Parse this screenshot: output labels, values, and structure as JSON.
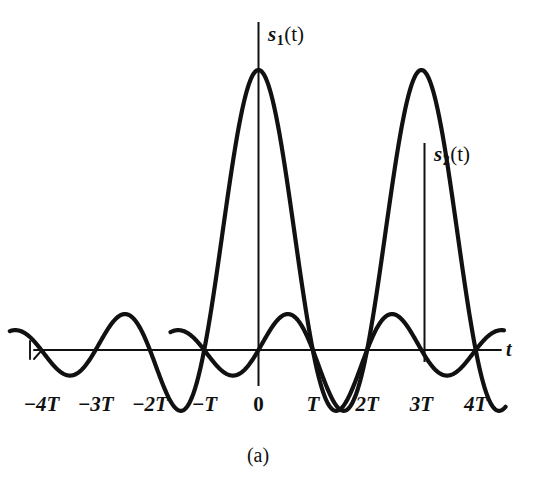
{
  "figure": {
    "caption": "(a)",
    "axis_label_t": "t",
    "background_color": "#ffffff",
    "ink_color": "#111111"
  },
  "signals": [
    {
      "name": "s1",
      "label_base": "s",
      "label_sub": "1",
      "label_arg": "(t)",
      "center_tick": "0"
    },
    {
      "name": "s2",
      "label_base": "s",
      "label_sub": "2",
      "label_arg": "(t)",
      "center_tick": "3T"
    }
  ],
  "ticks": [
    {
      "label": "−4T",
      "value": -4,
      "italic": true
    },
    {
      "label": "−3T",
      "value": -3,
      "italic": true
    },
    {
      "label": "−2T",
      "value": -2,
      "italic": true
    },
    {
      "label": "−T",
      "value": -1,
      "italic": true
    },
    {
      "label": "0",
      "value": 0,
      "italic": false
    },
    {
      "label": "T",
      "value": 1,
      "italic": true
    },
    {
      "label": "2T",
      "value": 2,
      "italic": true
    },
    {
      "label": "3T",
      "value": 3,
      "italic": true
    },
    {
      "label": "4T",
      "value": 4,
      "italic": true
    }
  ],
  "chart_data": {
    "type": "line",
    "title": "",
    "subtitle": "(a)",
    "xlabel": "t",
    "ylabel": "",
    "grid": false,
    "legend": "inline-annotations",
    "xlim": [
      -4.6,
      4.6
    ],
    "ylim": [
      -0.28,
      1.12
    ],
    "x_tick_values": [
      -4,
      -3,
      -2,
      -1,
      0,
      1,
      2,
      3,
      4
    ],
    "x_tick_labels": [
      "−4T",
      "−3T",
      "−2T",
      "−T",
      "0",
      "T",
      "2T",
      "3T",
      "4T"
    ],
    "x_unit": "T",
    "annotations": [
      {
        "text": "s1(t)",
        "at_x": 0,
        "at_y": 1.0,
        "stem": true
      },
      {
        "text": "s2(t)",
        "at_x": 3,
        "at_y": 1.0,
        "stem": true
      }
    ],
    "series": [
      {
        "name": "s1(t)",
        "formula": "sinc(t/T)",
        "peak_x": 0,
        "peak_y": 1.0,
        "zeros_at": [
          -4,
          -3,
          -2,
          -1,
          1,
          2,
          3,
          4
        ],
        "x": [
          -4.6,
          -4.5,
          -4,
          -3.5,
          -3,
          -2.5,
          -2,
          -1.5,
          -1,
          -0.75,
          -0.5,
          -0.25,
          0,
          0.25,
          0.5,
          0.75,
          1,
          1.5,
          2,
          2.5,
          3,
          3.5,
          4,
          4.5,
          4.6
        ],
        "values": [
          0.06,
          0.071,
          0,
          -0.091,
          0,
          0.127,
          0,
          -0.212,
          0,
          0.3,
          0.637,
          0.9,
          1.0,
          0.9,
          0.637,
          0.3,
          0,
          -0.212,
          0,
          0.127,
          0,
          -0.091,
          0,
          0.071,
          0.06
        ]
      },
      {
        "name": "s2(t)",
        "formula": "sinc((t-3T)/T)",
        "peak_x": 3,
        "peak_y": 1.0,
        "zeros_at": [
          -1,
          0,
          1,
          2,
          4
        ],
        "x": [
          -1.6,
          -1.5,
          -1,
          -0.5,
          0,
          0.5,
          1,
          1.5,
          2,
          2.25,
          2.5,
          2.75,
          3,
          3.25,
          3.5,
          3.75,
          4,
          4.5,
          4.6
        ],
        "values": [
          -0.069,
          -0.071,
          0,
          0.091,
          0,
          -0.127,
          0,
          0.212,
          0,
          0.3,
          0.637,
          0.9,
          1.0,
          0.9,
          0.637,
          0.3,
          0,
          -0.212,
          -0.2
        ]
      }
    ]
  }
}
